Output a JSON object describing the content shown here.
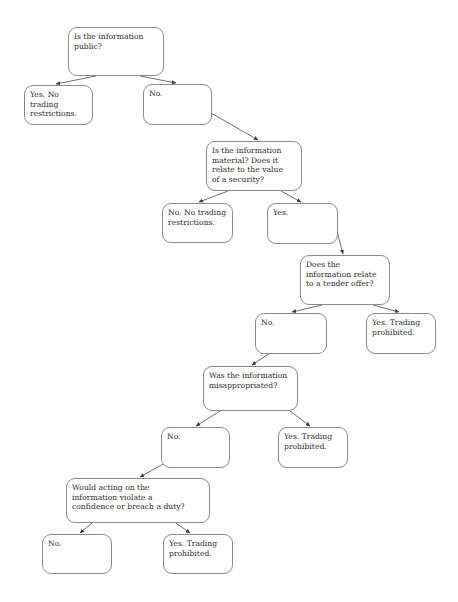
{
  "diagram": {
    "canvas": {
      "width": 458,
      "height": 602,
      "background": "#ffffff"
    },
    "style": {
      "node_border_color": "#8a8a8a",
      "node_fill": "#ffffff",
      "text_color": "#2b2b2b",
      "edge_color": "#4a4a4a"
    },
    "nodes": [
      {
        "id": "q-public",
        "kind": "question",
        "text": "Is the information\npublic?",
        "x": 68,
        "y": 27,
        "w": 96,
        "h": 49
      },
      {
        "id": "a-public-yes",
        "kind": "outcome",
        "text": "Yes. No\ntrading\nrestrictions.",
        "x": 24,
        "y": 85,
        "w": 69,
        "h": 40
      },
      {
        "id": "a-public-no",
        "kind": "branch",
        "text": "No.",
        "x": 143,
        "y": 84,
        "w": 69,
        "h": 41
      },
      {
        "id": "q-material",
        "kind": "question",
        "text": "Is the information\nmaterial? Does it\nrelate to the value\nof a security?",
        "x": 206,
        "y": 141,
        "w": 96,
        "h": 50
      },
      {
        "id": "a-material-no",
        "kind": "outcome",
        "text": "No. No trading\nrestrictions.",
        "x": 162,
        "y": 203,
        "w": 71,
        "h": 40
      },
      {
        "id": "a-material-yes",
        "kind": "branch",
        "text": "Yes.",
        "x": 267,
        "y": 203,
        "w": 71,
        "h": 41
      },
      {
        "id": "q-tender",
        "kind": "question",
        "text": "Does the\ninformation relate\nto a tender offer?",
        "x": 300,
        "y": 255,
        "w": 90,
        "h": 50
      },
      {
        "id": "a-tender-no",
        "kind": "branch",
        "text": "No.",
        "x": 255,
        "y": 313,
        "w": 72,
        "h": 41
      },
      {
        "id": "a-tender-yes",
        "kind": "outcome",
        "text": "Yes. Trading\nprohibited.",
        "x": 366,
        "y": 313,
        "w": 70,
        "h": 41
      },
      {
        "id": "q-misappropriated",
        "kind": "question",
        "text": "Was the information\nmisappropriated?",
        "x": 203,
        "y": 366,
        "w": 95,
        "h": 45
      },
      {
        "id": "a-misapp-no",
        "kind": "branch",
        "text": "No.",
        "x": 161,
        "y": 427,
        "w": 69,
        "h": 41
      },
      {
        "id": "a-misapp-yes",
        "kind": "outcome",
        "text": "Yes. Trading\nprohibited.",
        "x": 278,
        "y": 427,
        "w": 70,
        "h": 41
      },
      {
        "id": "q-duty",
        "kind": "question",
        "text": "Would acting on the\ninformation violate a\nconfidence or breach a duty?",
        "x": 66,
        "y": 478,
        "w": 144,
        "h": 45
      },
      {
        "id": "a-duty-no",
        "kind": "outcome",
        "text": "No.",
        "x": 42,
        "y": 534,
        "w": 70,
        "h": 40
      },
      {
        "id": "a-duty-yes",
        "kind": "outcome",
        "text": "Yes. Trading\nprohibited.",
        "x": 163,
        "y": 534,
        "w": 70,
        "h": 40
      }
    ],
    "edges": [
      {
        "from": "q-public",
        "to": "a-public-yes",
        "x1": 96,
        "y1": 76,
        "x2": 56,
        "y2": 84
      },
      {
        "from": "q-public",
        "to": "a-public-no",
        "x1": 140,
        "y1": 76,
        "x2": 176,
        "y2": 83
      },
      {
        "from": "a-public-no",
        "to": "q-material",
        "x1": 211,
        "y1": 113,
        "x2": 258,
        "y2": 140
      },
      {
        "from": "q-material",
        "to": "a-material-no",
        "x1": 228,
        "y1": 191,
        "x2": 199,
        "y2": 202
      },
      {
        "from": "q-material",
        "to": "a-material-yes",
        "x1": 281,
        "y1": 191,
        "x2": 301,
        "y2": 202
      },
      {
        "from": "a-material-yes",
        "to": "q-tender",
        "x1": 337,
        "y1": 231,
        "x2": 343,
        "y2": 254
      },
      {
        "from": "q-tender",
        "to": "a-tender-no",
        "x1": 322,
        "y1": 305,
        "x2": 292,
        "y2": 312
      },
      {
        "from": "q-tender",
        "to": "a-tender-yes",
        "x1": 373,
        "y1": 305,
        "x2": 399,
        "y2": 312
      },
      {
        "from": "a-tender-no",
        "to": "q-misappropriated",
        "x1": 270,
        "y1": 353,
        "x2": 252,
        "y2": 365
      },
      {
        "from": "q-misappropriated",
        "to": "a-misapp-no",
        "x1": 220,
        "y1": 411,
        "x2": 196,
        "y2": 426
      },
      {
        "from": "q-misappropriated",
        "to": "a-misapp-yes",
        "x1": 290,
        "y1": 411,
        "x2": 310,
        "y2": 426
      },
      {
        "from": "a-misapp-no",
        "to": "q-duty",
        "x1": 176,
        "y1": 457,
        "x2": 140,
        "y2": 477
      },
      {
        "from": "q-duty",
        "to": "a-duty-no",
        "x1": 92,
        "y1": 523,
        "x2": 80,
        "y2": 533
      },
      {
        "from": "q-duty",
        "to": "a-duty-yes",
        "x1": 176,
        "y1": 523,
        "x2": 190,
        "y2": 533
      }
    ]
  }
}
